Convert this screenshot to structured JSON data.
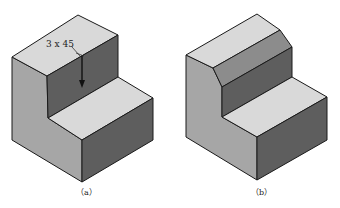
{
  "figure": {
    "panels": [
      {
        "id": "a",
        "caption": "（a）",
        "description": "L-shaped stepped block with chamfer callout",
        "annotation": {
          "text": "3 x 45",
          "meaning": "chamfer 3 × 45°"
        }
      },
      {
        "id": "b",
        "caption": "（b）",
        "description": "Same L-shaped block with 45° chamfer applied to top edge"
      }
    ],
    "colors": {
      "top_face": "#d9d9d9",
      "left_face": "#a6a6a6",
      "front_dark_face": "#5e5e5e",
      "chamfer_face": "#8c8c8c",
      "edge": "#1a1a1a"
    }
  }
}
